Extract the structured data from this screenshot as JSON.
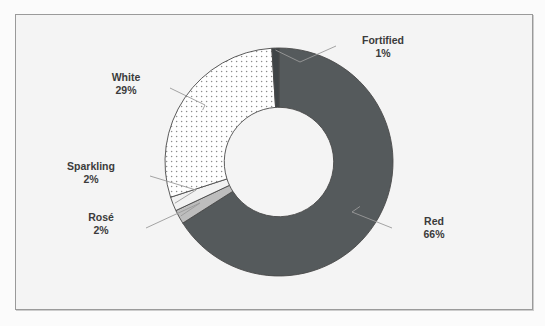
{
  "figure": {
    "background_color": "#f4f4f4",
    "frame_color": "#9a9a9a",
    "bleed_text_line1": "Red wine was consistently won awards, white wine saw",
    "bleed_text_line2": "growing interest. The following sections are informed by the",
    "bleed_text_line3": "challenging reviews"
  },
  "chart_data": {
    "type": "pie",
    "variant": "donut",
    "title": "",
    "xlabel": "",
    "ylabel": "",
    "legend_position": "none",
    "labels_outside": true,
    "start_angle_deg": 0,
    "direction": "clockwise",
    "inner_radius_ratio": 0.48,
    "categories": [
      "Red",
      "Rosé",
      "Sparkling",
      "White",
      "Fortified"
    ],
    "values": [
      66,
      2,
      2,
      29,
      1
    ],
    "unit": "%",
    "slices": [
      {
        "name": "Red",
        "label": "Red",
        "value": 66,
        "value_label": "66%",
        "color": "#555a5c",
        "pattern": "solid"
      },
      {
        "name": "Rosé",
        "label": "Rosé",
        "value": 2,
        "value_label": "2%",
        "color": "#bdbdbd",
        "pattern": "solid"
      },
      {
        "name": "Sparkling",
        "label": "Sparkling",
        "value": 2,
        "value_label": "2%",
        "color": "#f2f2f2",
        "pattern": "solid"
      },
      {
        "name": "White",
        "label": "White",
        "value": 29,
        "value_label": "29%",
        "color": "#ffffff",
        "pattern": "dotted"
      },
      {
        "name": "Fortified",
        "label": "Fortified",
        "value": 1,
        "value_label": "1%",
        "color": "#3f4446",
        "pattern": "solid"
      }
    ]
  }
}
